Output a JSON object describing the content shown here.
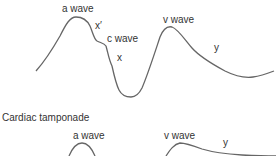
{
  "top_panel": {
    "labels": {
      "a_wave": "a wave",
      "x_prime": "x′",
      "c_wave": "c wave",
      "x": "x",
      "v_wave": "v wave",
      "y": "y"
    },
    "stroke_color": "#666666"
  },
  "bottom_panel": {
    "title": "Cardiac tamponade",
    "labels": {
      "a_wave": "a wave",
      "v_wave": "v wave",
      "y": "y"
    },
    "stroke_color": "#666666"
  }
}
